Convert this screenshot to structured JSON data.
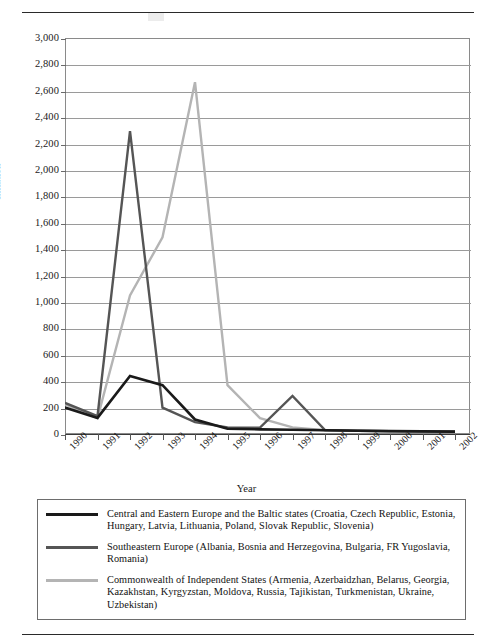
{
  "page": {
    "rules": [
      "top-rule",
      "bottom-rule"
    ]
  },
  "chart_data": {
    "type": "line",
    "title": "",
    "xlabel": "Year",
    "ylabel": "Inflation",
    "grid": true,
    "legend_position": "below",
    "x": [
      1990,
      1991,
      1992,
      1993,
      1994,
      1995,
      1996,
      1997,
      1998,
      1999,
      2000,
      2001,
      2002
    ],
    "xtick_labels": [
      "1990",
      "1991",
      "1992",
      "1993",
      "1994",
      "1995",
      "1996",
      "1997",
      "1998",
      "1999",
      "2000",
      "2001",
      "2002"
    ],
    "ylim": [
      0,
      3000
    ],
    "ytick_labels": [
      "3,000",
      "2,800",
      "2,600",
      "2,400",
      "2,200",
      "2,000",
      "1,800",
      "1,600",
      "1,400",
      "1,200",
      "1,000",
      "800",
      "600",
      "400",
      "200",
      "0"
    ],
    "ytick_values": [
      3000,
      2800,
      2600,
      2400,
      2200,
      2000,
      1800,
      1600,
      1400,
      1200,
      1000,
      800,
      600,
      400,
      200,
      0
    ],
    "series": [
      {
        "name": "Central and Eastern Europe and the Baltic states",
        "color": "#1a1a1a",
        "values": [
          200,
          122,
          440,
          370,
          110,
          40,
          35,
          32,
          28,
          25,
          22,
          20,
          18
        ]
      },
      {
        "name": "Southeastern Europe",
        "color": "#555555",
        "values": [
          235,
          135,
          2295,
          200,
          90,
          50,
          48,
          288,
          30,
          25,
          22,
          20,
          18
        ]
      },
      {
        "name": "Commonwealth of Independent States",
        "color": "#b4b4b4",
        "values": [
          225,
          120,
          1050,
          1490,
          2665,
          370,
          120,
          50,
          28,
          25,
          22,
          20,
          18
        ]
      }
    ]
  },
  "legend": {
    "entries": [
      {
        "swatch_color": "#1a1a1a",
        "label": "Central and Eastern Europe and the Baltic states (Croatia, Czech Republic, Estonia, Hungary, Latvia, Lithuania, Poland, Slovak Republic, Slovenia)"
      },
      {
        "swatch_color": "#555555",
        "label": "Southeastern Europe (Albania, Bosnia and Herzegovina, Bulgaria, FR Yugoslavia, Romania)"
      },
      {
        "swatch_color": "#b4b4b4",
        "label": "Commonwealth of Independent States (Armenia, Azerbaidzhan, Belarus, Georgia, Kazakhstan, Kyrgyzstan, Moldova, Russia, Tajikistan, Turkmenistan, Ukraine, Uzbekistan)"
      }
    ]
  }
}
